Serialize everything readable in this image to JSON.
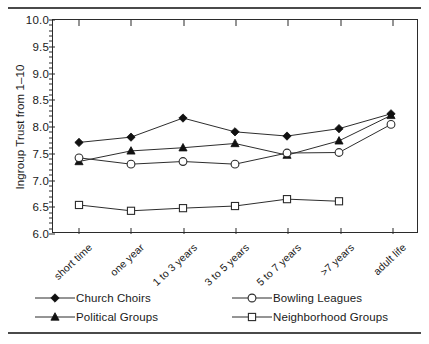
{
  "chart_data": {
    "type": "line",
    "title": "",
    "xlabel": "",
    "ylabel": "Ingroup Trust from 1–10",
    "categories": [
      "short time",
      "one year",
      "1 to 3 years",
      "3 to 5 years",
      "5 to 7 years",
      ">7 years",
      "adult life"
    ],
    "ylim": [
      6.0,
      10.0
    ],
    "ytick_labels": [
      "6.0",
      "6.5",
      "7.0",
      "7.5",
      "8.0",
      "8.5",
      "9.0",
      "9.5",
      "10.0"
    ],
    "ytick_values": [
      6.0,
      6.5,
      7.0,
      7.5,
      8.0,
      8.5,
      9.0,
      9.5,
      10.0
    ],
    "grid": false,
    "legend_position": "below-plot",
    "series": [
      {
        "name": "Church Choirs",
        "marker": "filled-diamond",
        "values": [
          7.69,
          7.79,
          8.15,
          7.89,
          7.81,
          7.95,
          8.23
        ]
      },
      {
        "name": "Political Groups",
        "marker": "filled-triangle",
        "values": [
          7.33,
          7.53,
          7.59,
          7.67,
          7.45,
          7.72,
          8.2
        ]
      },
      {
        "name": "Bowling Leagues",
        "marker": "open-circle",
        "values": [
          7.4,
          7.28,
          7.33,
          7.28,
          7.49,
          7.5,
          8.03
        ]
      },
      {
        "name": "Neighborhood Groups",
        "marker": "open-square",
        "values": [
          6.51,
          6.4,
          6.45,
          6.49,
          6.62,
          6.58,
          null
        ]
      }
    ]
  },
  "legend": {
    "entries": [
      {
        "label": "Church Choirs",
        "marker": "filled-diamond"
      },
      {
        "label": "Political Groups",
        "marker": "filled-triangle"
      },
      {
        "label": "Bowling Leagues",
        "marker": "open-circle"
      },
      {
        "label": "Neighborhood Groups",
        "marker": "open-square"
      }
    ]
  },
  "colors": {
    "line": "#2b2b2b",
    "axis": "#2b2b2b",
    "text": "#1a1a1a",
    "rule": "#4a4a4a",
    "marker_fill": "#111111",
    "marker_open": "#ffffff"
  }
}
